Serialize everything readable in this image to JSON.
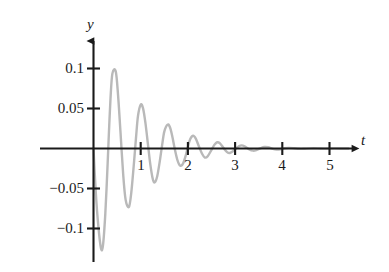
{
  "chart_data": {
    "type": "line",
    "title": "",
    "subtitle": "",
    "xlabel": "t",
    "ylabel": "y",
    "xlim": [
      -0.12,
      5.45
    ],
    "ylim": [
      -0.145,
      0.125
    ],
    "grid": false,
    "legend": "none",
    "annotations": [],
    "axis_style": "arrow-ended axes through origin",
    "curve_color": "#b9b9b9",
    "axis_color": "#1a1a1a",
    "x_ticks": [
      1,
      2,
      3,
      4,
      5
    ],
    "x_tick_labels": [
      "1",
      "2",
      "3",
      "4",
      "5"
    ],
    "y_ticks": [
      0.1,
      0.05,
      -0.05,
      -0.1
    ],
    "y_tick_labels": [
      "0.1",
      "0.05",
      "−0.05",
      "−0.1"
    ],
    "equation": "y = -0.132 e^(-1.55 t) sin(10.0 t)",
    "series": [
      {
        "name": "damped oscillation",
        "points": [
          [
            0.0,
            0.0
          ],
          [
            0.05,
            -0.0563
          ],
          [
            0.1,
            -0.0954
          ],
          [
            0.157,
            -0.1243
          ],
          [
            0.2,
            -0.1215
          ],
          [
            0.25,
            -0.0818
          ],
          [
            0.3,
            -0.0183
          ],
          [
            0.32,
            0.0103
          ],
          [
            0.36,
            0.0622
          ],
          [
            0.4,
            0.0936
          ],
          [
            0.471,
            0.0964
          ],
          [
            0.52,
            0.0671
          ],
          [
            0.57,
            0.0223
          ],
          [
            0.628,
            -0.0316
          ],
          [
            0.68,
            -0.0639
          ],
          [
            0.75,
            -0.0732
          ],
          [
            0.8,
            -0.0554
          ],
          [
            0.85,
            -0.0231
          ],
          [
            0.9,
            0.0129
          ],
          [
            0.942,
            0.0404
          ],
          [
            1.0,
            0.0549
          ],
          [
            1.05,
            0.0502
          ],
          [
            1.1,
            0.0321
          ],
          [
            1.15,
            0.0071
          ],
          [
            1.2,
            -0.0183
          ],
          [
            1.256,
            -0.0382
          ],
          [
            1.3,
            -0.0422
          ],
          [
            1.35,
            -0.0346
          ],
          [
            1.4,
            -0.0176
          ],
          [
            1.45,
            0.0027
          ],
          [
            1.5,
            0.0211
          ],
          [
            1.57,
            0.0298
          ],
          [
            1.62,
            0.0265
          ],
          [
            1.67,
            0.0151
          ],
          [
            1.72,
            0.0001
          ],
          [
            1.78,
            -0.0148
          ],
          [
            1.84,
            -0.0216
          ],
          [
            1.9,
            -0.0185
          ],
          [
            1.96,
            -0.0076
          ],
          [
            2.0,
            0.0021
          ],
          [
            2.05,
            0.0118
          ],
          [
            2.11,
            0.0159
          ],
          [
            2.17,
            0.0121
          ],
          [
            2.23,
            0.0031
          ],
          [
            2.3,
            -0.0066
          ],
          [
            2.36,
            -0.0113
          ],
          [
            2.42,
            -0.0096
          ],
          [
            2.5,
            -0.0017
          ],
          [
            2.56,
            0.0045
          ],
          [
            2.62,
            0.0078
          ],
          [
            2.68,
            0.0064
          ],
          [
            2.76,
            0.0003
          ],
          [
            2.83,
            -0.0045
          ],
          [
            2.89,
            -0.0056
          ],
          [
            2.96,
            -0.0032
          ],
          [
            3.0,
            -0.0009
          ],
          [
            3.08,
            0.0029
          ],
          [
            3.14,
            0.0039
          ],
          [
            3.2,
            0.0028
          ],
          [
            3.3,
            -0.0011
          ],
          [
            3.38,
            -0.0027
          ],
          [
            3.45,
            -0.002
          ],
          [
            3.55,
            0.0006
          ],
          [
            3.62,
            0.0018
          ],
          [
            3.7,
            0.0015
          ],
          [
            3.8,
            -0.0004
          ],
          [
            3.88,
            -0.0012
          ],
          [
            3.96,
            -0.0009
          ],
          [
            4.05,
            0.0003
          ],
          [
            4.14,
            0.0008
          ],
          [
            4.25,
            0.0003
          ],
          [
            4.35,
            -0.0004
          ],
          [
            4.45,
            -0.0004
          ],
          [
            4.6,
            0.0002
          ],
          [
            4.75,
            0.0002
          ],
          [
            4.9,
            -0.0001
          ],
          [
            5.1,
            0.0001
          ],
          [
            5.3,
            0.0
          ],
          [
            5.4,
            0.0
          ]
        ]
      }
    ]
  },
  "axes": {
    "y_name": "y",
    "x_name": "t"
  },
  "y_labels": [
    {
      "text": "0.1",
      "value": 0.1
    },
    {
      "text": "0.05",
      "value": 0.05
    },
    {
      "text": "−0.05",
      "value": -0.05
    },
    {
      "text": "−0.1",
      "value": -0.1
    }
  ],
  "x_labels": [
    {
      "text": "1",
      "value": 1
    },
    {
      "text": "2",
      "value": 2
    },
    {
      "text": "3",
      "value": 3
    },
    {
      "text": "4",
      "value": 4
    },
    {
      "text": "5",
      "value": 5
    }
  ]
}
